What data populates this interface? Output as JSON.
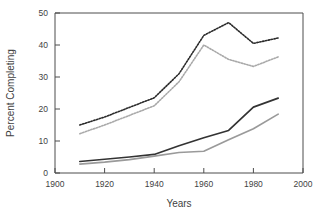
{
  "chart_data": {
    "type": "line",
    "title": "",
    "xlabel": "Years",
    "ylabel": "Percent Completing",
    "xlim": [
      1900,
      2000
    ],
    "ylim": [
      0,
      50
    ],
    "xticks": [
      1900,
      1920,
      1940,
      1960,
      1980,
      2000
    ],
    "yticks": [
      0,
      10,
      20,
      30,
      40,
      50
    ],
    "grid": false,
    "legend": "none",
    "x": [
      1910,
      1920,
      1930,
      1940,
      1950,
      1960,
      1970,
      1980,
      1990
    ],
    "series": [
      {
        "name": "upper-dotted-dark",
        "style": "dotted",
        "color": "#2b2b2b",
        "values": [
          15.0,
          17.5,
          20.5,
          23.5,
          31.0,
          43.0,
          47.0,
          40.5,
          42.2
        ]
      },
      {
        "name": "upper-dotted-light",
        "style": "dotted",
        "color": "#a9a9a9",
        "values": [
          12.3,
          15.0,
          18.0,
          21.0,
          28.5,
          40.0,
          35.5,
          33.3,
          36.3
        ]
      },
      {
        "name": "lower-solid-dark",
        "style": "solid",
        "color": "#333333",
        "values": [
          3.6,
          4.3,
          5.0,
          5.8,
          8.5,
          11.0,
          13.3,
          20.6,
          23.4
        ]
      },
      {
        "name": "lower-solid-light",
        "style": "solid",
        "color": "#9a9a9a",
        "values": [
          2.8,
          3.4,
          4.2,
          5.3,
          6.4,
          6.8,
          10.4,
          13.8,
          18.4
        ]
      }
    ]
  },
  "axes": {
    "y_label": "Percent Completing",
    "x_label": "Years",
    "y_tick_labels": [
      "0",
      "10",
      "20",
      "30",
      "40",
      "50"
    ],
    "x_tick_labels": [
      "1900",
      "1920",
      "1940",
      "1960",
      "1980",
      "2000"
    ]
  },
  "colors": {
    "background": "#ffffff",
    "axis": "#4d4d4d",
    "text": "#3f3f3f",
    "series_dark_dotted": "#2b2b2b",
    "series_light_dotted": "#a9a9a9",
    "series_dark_solid": "#333333",
    "series_light_solid": "#9a9a9a"
  }
}
